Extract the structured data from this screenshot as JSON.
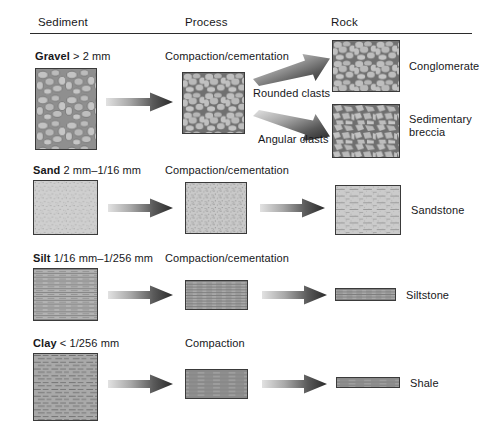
{
  "headers": [
    {
      "label": "Sediment",
      "name": "column-header-sediment"
    },
    {
      "label": "Process",
      "name": "column-header-process"
    },
    {
      "label": "Rock",
      "name": "column-header-rock"
    }
  ],
  "rows": [
    {
      "id": "gravel",
      "sediment_name": "Gravel",
      "sediment_size": "> 2 mm",
      "sediment_label": "Gravel > 2 mm",
      "process": "Compaction/cementation",
      "branch_labels": [
        "Rounded clasts",
        "Angular clasts"
      ],
      "rocks": [
        "Conglomerate",
        "Sedimentary breccia"
      ],
      "texture": "pebbles"
    },
    {
      "id": "sand",
      "sediment_name": "Sand",
      "sediment_size": "2 mm–1/16 mm",
      "sediment_label": "Sand 2 mm–1/16 mm",
      "process": "Compaction/cementation",
      "branch_labels": [],
      "rocks": [
        "Sandstone"
      ],
      "texture": "grains"
    },
    {
      "id": "silt",
      "sediment_name": "Silt",
      "sediment_size": "1/16 mm–1/256 mm",
      "sediment_label": "Silt 1/16 mm–1/256 mm",
      "process": "Compaction/cementation",
      "branch_labels": [],
      "rocks": [
        "Siltstone"
      ],
      "texture": "fine-lines"
    },
    {
      "id": "clay",
      "sediment_name": "Clay",
      "sediment_size": "< 1/256 mm",
      "sediment_label": "Clay < 1/256 mm",
      "process": "Compaction",
      "branch_labels": [],
      "rocks": [
        "Shale"
      ],
      "texture": "dashes"
    }
  ],
  "colors": {
    "ink": "#17171a",
    "rule": "#2b2b2b",
    "box_border": "#3a3a3a",
    "texture_fill": "#b0b0b0",
    "texture_line": "#6d6d6d",
    "arrow_dark": "#303030",
    "arrow_light": "#d8d8d8",
    "page_background": "#ffffff"
  }
}
